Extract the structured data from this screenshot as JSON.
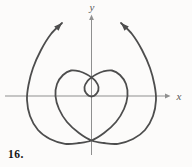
{
  "figure": {
    "number_label": "16.",
    "background": "#fcfbfa"
  },
  "chart_data": {
    "type": "line",
    "subtype": "parametric-curve",
    "xlabel": "x",
    "ylabel": "y",
    "grid": false,
    "tick_labels": [],
    "axes": {
      "color": "#8f8f8f",
      "stroke_width": 1,
      "origin_px": [
        91.5,
        96
      ],
      "x_axis_px": {
        "x1": 5,
        "y1": 96,
        "x2": 167,
        "y2": 96
      },
      "y_axis_px": {
        "x1": 91.5,
        "y1": 155,
        "x2": 91.5,
        "y2": 18
      },
      "arrowhead_len": 5.5,
      "arrowhead_halfwidth": 2.4
    },
    "curve": {
      "color": "#4d4d4d",
      "stroke_width": 1.8,
      "direction_arrows": "both-ends",
      "arrowhead_len": 8,
      "arrowhead_halfwidth": 3.1,
      "points_px": [
        [
          62,
          23
        ],
        [
          51,
          34
        ],
        [
          41,
          50
        ],
        [
          33,
          68
        ],
        [
          28.5,
          85
        ],
        [
          27,
          100
        ],
        [
          30,
          116
        ],
        [
          38,
          130
        ],
        [
          50,
          139
        ],
        [
          65,
          143.8
        ],
        [
          79,
          143
        ],
        [
          91.5,
          140.5
        ],
        [
          104,
          133
        ],
        [
          116,
          122
        ],
        [
          124,
          109
        ],
        [
          127.5,
          96
        ],
        [
          126,
          84
        ],
        [
          120,
          75
        ],
        [
          112,
          70.5
        ],
        [
          103,
          71.5
        ],
        [
          96,
          74.5
        ],
        [
          91.5,
          77.5
        ],
        [
          87.5,
          81
        ],
        [
          84.5,
          87
        ],
        [
          86,
          93
        ],
        [
          91.5,
          96.5
        ],
        [
          97,
          93
        ],
        [
          98.5,
          87
        ],
        [
          95.5,
          81
        ],
        [
          91.5,
          77.5
        ],
        [
          87,
          74.5
        ],
        [
          80,
          71.5
        ],
        [
          71,
          70.5
        ],
        [
          63,
          75
        ],
        [
          57,
          84
        ],
        [
          55.5,
          96
        ],
        [
          59,
          109
        ],
        [
          67,
          122
        ],
        [
          79,
          133
        ],
        [
          91.5,
          140.5
        ],
        [
          104,
          143
        ],
        [
          118,
          143.8
        ],
        [
          133,
          139
        ],
        [
          145,
          130
        ],
        [
          153,
          116
        ],
        [
          156,
          100
        ],
        [
          154.5,
          85
        ],
        [
          150,
          68
        ],
        [
          142,
          50
        ],
        [
          132,
          34
        ],
        [
          121,
          23
        ]
      ],
      "key_features": {
        "self_intersections_px": [
          [
            91.5,
            77.5
          ],
          [
            91.5,
            140.5
          ]
        ],
        "inner_loop_bottom_px": [
          91.5,
          96.5
        ],
        "arm_tips_px": [
          [
            62,
            23
          ],
          [
            121,
            23
          ]
        ]
      }
    }
  }
}
